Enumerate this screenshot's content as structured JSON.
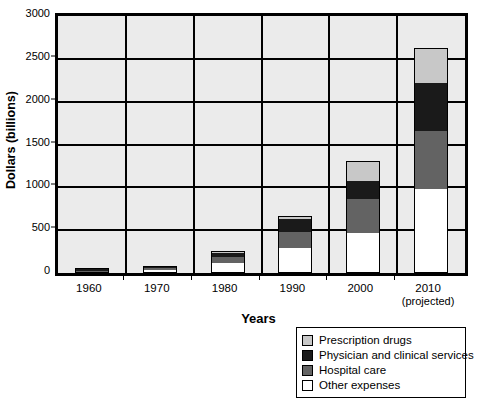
{
  "chart_data": {
    "type": "bar",
    "subtype": "stacked-bar",
    "title": "",
    "xlabel": "Years",
    "ylabel": "Dollars (billions)",
    "ylim": [
      0,
      3000
    ],
    "ytick_step": 500,
    "yticks": [
      0,
      500,
      1000,
      1500,
      2000,
      2500,
      3000
    ],
    "ytick_labels": [
      "0",
      "500",
      "1000",
      "1500",
      "2000",
      "2500",
      "3000"
    ],
    "grid": true,
    "grid_axis": "y",
    "legend_position": "bottom-right",
    "categories": [
      "1960",
      "1970",
      "1980",
      "1990",
      "2000",
      "2010"
    ],
    "category_sublabels": [
      "",
      "",
      "",
      "",
      "",
      "(projected)"
    ],
    "series": [
      {
        "name": "Other expenses",
        "color": "#ffffff",
        "values": [
          12,
          34,
          115,
          290,
          470,
          975
        ]
      },
      {
        "name": "Hospital care",
        "color": "#636363",
        "values": [
          9,
          23,
          72,
          185,
          390,
          680
        ]
      },
      {
        "name": "Physician and clinical services",
        "color": "#1a1a1a",
        "values": [
          5,
          14,
          48,
          160,
          215,
          560
        ]
      },
      {
        "name": "Prescription drugs",
        "color": "#c8c8c8",
        "values": [
          3,
          6,
          17,
          25,
          235,
          410
        ]
      }
    ],
    "totals": [
      29,
      77,
      252,
      660,
      1310,
      2625
    ],
    "stack_order_bottom_to_top": [
      "Other expenses",
      "Hospital care",
      "Physician and clinical services",
      "Prescription drugs"
    ],
    "legend_order_top_to_bottom": [
      "Prescription drugs",
      "Physician and clinical services",
      "Hospital care",
      "Other expenses"
    ],
    "plot_background": "#ebebeb",
    "axis_color": "#000000"
  },
  "legend": {
    "items": [
      {
        "label": "Prescription drugs",
        "color": "#c8c8c8"
      },
      {
        "label": "Physician and clinical services",
        "color": "#1a1a1a"
      },
      {
        "label": "Hospital care",
        "color": "#636363"
      },
      {
        "label": "Other expenses",
        "color": "#ffffff"
      }
    ]
  }
}
